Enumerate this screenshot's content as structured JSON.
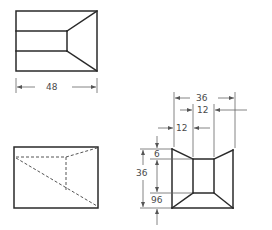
{
  "drawing": {
    "title": "Orthographic projection of a truncated pyramidal hollow",
    "top_view": {
      "dimension_width": "48"
    },
    "front_view": {},
    "side_view": {
      "dimension_overall_width": "36",
      "dimension_inner_offset_top": "12",
      "dimension_inner_offset_left": "12",
      "dimension_top_gap": "6",
      "dimension_overall_height": "36",
      "dimension_inner_height": "96"
    }
  },
  "colors": {
    "line": "#2a2a2a",
    "dimension": "#666666",
    "background": "#ffffff"
  }
}
